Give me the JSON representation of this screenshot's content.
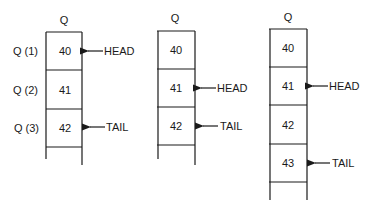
{
  "diagrams": [
    {
      "title": "Q",
      "cells": [
        "40",
        "41",
        "42",
        ""
      ],
      "row_labels": [
        "Q (1)",
        "Q (2)",
        "Q (3)"
      ],
      "pointers": [
        {
          "label": "HEAD",
          "row": 0
        },
        {
          "label": "TAIL",
          "row": 2
        }
      ]
    },
    {
      "title": "Q",
      "cells": [
        "40",
        "41",
        "42",
        ""
      ],
      "row_labels": [],
      "pointers": [
        {
          "label": "HEAD",
          "row": 1
        },
        {
          "label": "TAIL",
          "row": 2
        }
      ]
    },
    {
      "title": "Q",
      "cells": [
        "40",
        "41",
        "42",
        "43",
        ""
      ],
      "row_labels": [],
      "pointers": [
        {
          "label": "HEAD",
          "row": 1
        },
        {
          "label": "TAIL",
          "row": 3
        }
      ]
    }
  ]
}
